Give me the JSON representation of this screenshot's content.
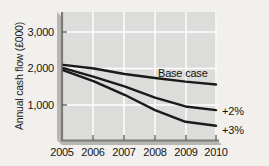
{
  "chart_data": {
    "type": "line",
    "title": "",
    "subtitle": "",
    "xlabel": "",
    "ylabel": "Annual cash flow (£000)",
    "x": [
      2005,
      2006,
      2007,
      2008,
      2009,
      2010
    ],
    "xtick_labels": [
      "2005",
      "2006",
      "2007",
      "2008",
      "2009",
      "2010"
    ],
    "ytick_labels": [
      "1,000",
      "2,000",
      "3,000"
    ],
    "yticks": [
      1000,
      2000,
      3000
    ],
    "ylim": [
      0,
      3400
    ],
    "xlim": [
      2005,
      2010
    ],
    "grid": true,
    "grid_color": "#ffffff",
    "plot_bg": "#dcdcda",
    "legend_position": "inline-right",
    "line_color": "#1a1a1a",
    "series": [
      {
        "name": "Base case",
        "label": "Base case",
        "values": [
          2100,
          2000,
          1850,
          1740,
          1640,
          1560
        ]
      },
      {
        "name": "+2%",
        "label": "+2%",
        "values": [
          2010,
          1770,
          1510,
          1200,
          960,
          860
        ]
      },
      {
        "name": "+3%",
        "label": "+3%",
        "values": [
          1950,
          1650,
          1280,
          860,
          540,
          430
        ]
      }
    ]
  }
}
